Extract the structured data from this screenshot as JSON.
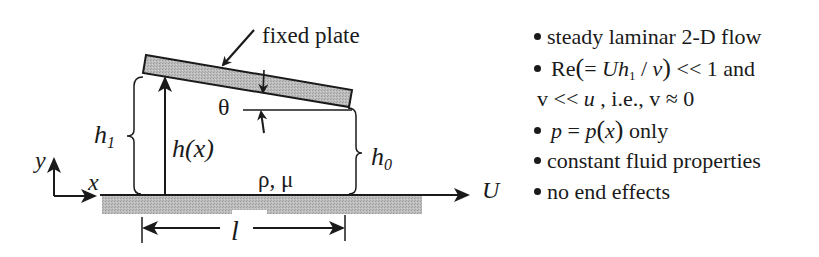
{
  "diagram": {
    "labels": {
      "fixed_plate": "fixed plate",
      "theta": "θ",
      "h1_main": "h",
      "h1_sub": "1",
      "hx": "h(x)",
      "h0_main": "h",
      "h0_sub": "0",
      "fluid_props": "ρ, μ",
      "axis_x": "x",
      "axis_y": "y",
      "velocity": "U",
      "length": "l"
    },
    "colors": {
      "line": "#1a1a1a",
      "plate_fill": "#b3b3b3",
      "ground_fill": "#b8b8b8",
      "background": "#ffffff"
    }
  },
  "assumptions": {
    "items": [
      {
        "text": "steady laminar 2-D flow"
      },
      {
        "prefix": "Re",
        "open": "(",
        "eq": "= ",
        "U": "U",
        "h": "h",
        "h_sub": "1",
        "slash": " / ",
        "nu": "ν",
        "close": ")",
        "tail": " <<  1 and"
      },
      {
        "v1": "v",
        "ll": " << ",
        "u": "u",
        "rest": " , i.e., ",
        "v2": "v",
        "approx": " ≈ 0"
      },
      {
        "p1": "p",
        "eq": " = ",
        "p2": "p",
        "open": "(",
        "x": "x",
        "close": ")",
        "tail": " only"
      },
      {
        "text": "constant fluid properties"
      },
      {
        "text": "no end effects"
      }
    ]
  }
}
